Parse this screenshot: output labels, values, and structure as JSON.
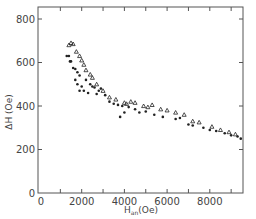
{
  "chart_data": {
    "type": "scatter",
    "title": "",
    "xlabel": "H_an (Oe)",
    "xlabel_main": "H",
    "xlabel_sub": "an",
    "xlabel_unit": "(Oe)",
    "ylabel": "ΔH (Oe)",
    "xlim": [
      0,
      9600
    ],
    "ylim": [
      0,
      850
    ],
    "x_ticks": [
      0,
      2000,
      4000,
      6000,
      8000
    ],
    "x_tick_labels": [
      "0",
      "2000",
      "4000",
      "6000",
      "8000"
    ],
    "x_minor_ticks": [
      1000,
      3000,
      5000,
      7000,
      9000
    ],
    "y_ticks": [
      0,
      200,
      400,
      600,
      800
    ],
    "y_tick_labels": [
      "0",
      "200",
      "400",
      "600",
      "800"
    ],
    "grid": false,
    "legend": null,
    "series": [
      {
        "name": "dots",
        "marker": "filled-circle",
        "points": [
          [
            1300,
            630
          ],
          [
            1400,
            630
          ],
          [
            1450,
            605
          ],
          [
            1500,
            605
          ],
          [
            1600,
            575
          ],
          [
            1700,
            570
          ],
          [
            1800,
            555
          ],
          [
            1900,
            540
          ],
          [
            1700,
            520
          ],
          [
            1800,
            500
          ],
          [
            2000,
            490
          ],
          [
            1900,
            470
          ],
          [
            2100,
            470
          ],
          [
            2200,
            520
          ],
          [
            2400,
            500
          ],
          [
            2500,
            490
          ],
          [
            2600,
            485
          ],
          [
            2300,
            460
          ],
          [
            2700,
            455
          ],
          [
            2800,
            470
          ],
          [
            2900,
            480
          ],
          [
            3100,
            450
          ],
          [
            3300,
            420
          ],
          [
            3500,
            410
          ],
          [
            3700,
            405
          ],
          [
            3900,
            400
          ],
          [
            4000,
            370
          ],
          [
            3800,
            350
          ],
          [
            4200,
            395
          ],
          [
            4500,
            385
          ],
          [
            4700,
            370
          ],
          [
            5000,
            375
          ],
          [
            5400,
            360
          ],
          [
            5800,
            350
          ],
          [
            6400,
            340
          ],
          [
            6600,
            345
          ],
          [
            7000,
            315
          ],
          [
            7200,
            310
          ],
          [
            7700,
            300
          ],
          [
            8000,
            290
          ],
          [
            8300,
            285
          ],
          [
            8700,
            275
          ],
          [
            9000,
            265
          ],
          [
            9300,
            260
          ],
          [
            9450,
            250
          ]
        ]
      },
      {
        "name": "triangles",
        "marker": "open-triangle",
        "points": [
          [
            1400,
            680
          ],
          [
            1500,
            690
          ],
          [
            1600,
            685
          ],
          [
            1750,
            650
          ],
          [
            1900,
            630
          ],
          [
            2000,
            610
          ],
          [
            2100,
            590
          ],
          [
            2200,
            565
          ],
          [
            2400,
            545
          ],
          [
            2500,
            530
          ],
          [
            2700,
            500
          ],
          [
            3000,
            470
          ],
          [
            3300,
            440
          ],
          [
            3600,
            430
          ],
          [
            4000,
            415
          ],
          [
            4100,
            410
          ],
          [
            4300,
            420
          ],
          [
            4500,
            415
          ],
          [
            4900,
            400
          ],
          [
            5100,
            395
          ],
          [
            5300,
            405
          ],
          [
            5700,
            385
          ],
          [
            6000,
            380
          ],
          [
            6400,
            370
          ],
          [
            6800,
            360
          ],
          [
            7200,
            330
          ],
          [
            7500,
            325
          ],
          [
            8100,
            305
          ],
          [
            8500,
            290
          ],
          [
            8900,
            280
          ],
          [
            9200,
            270
          ]
        ]
      }
    ]
  }
}
